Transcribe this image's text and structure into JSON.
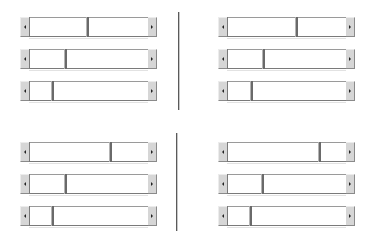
{
  "layout": {
    "groups": [
      {
        "name": "top-left",
        "x": 20,
        "width": 137,
        "rows": [
          {
            "y": 17,
            "thumb_pos": 57
          },
          {
            "y": 49,
            "thumb_pos": 35
          },
          {
            "y": 81,
            "thumb_pos": 22
          }
        ]
      },
      {
        "name": "top-right",
        "x": 218,
        "width": 137,
        "rows": [
          {
            "y": 17,
            "thumb_pos": 68
          },
          {
            "y": 49,
            "thumb_pos": 35
          },
          {
            "y": 81,
            "thumb_pos": 23
          }
        ]
      },
      {
        "name": "bottom-left",
        "x": 20,
        "width": 137,
        "rows": [
          {
            "y": 142,
            "thumb_pos": 80
          },
          {
            "y": 174,
            "thumb_pos": 35
          },
          {
            "y": 206,
            "thumb_pos": 22
          }
        ]
      },
      {
        "name": "bottom-right",
        "x": 218,
        "width": 137,
        "rows": [
          {
            "y": 142,
            "thumb_pos": 91
          },
          {
            "y": 174,
            "thumb_pos": 34
          },
          {
            "y": 206,
            "thumb_pos": 22
          }
        ]
      }
    ],
    "dividers": [
      {
        "x": 178,
        "top": 12,
        "bottom": 110
      },
      {
        "x": 176,
        "top": 133,
        "bottom": 231
      }
    ]
  },
  "icons": {
    "left_arrow": "left-arrow-icon",
    "right_arrow": "right-arrow-icon"
  },
  "colors": {
    "button_face": "#d6d6d6",
    "track": "#ffffff",
    "thumb_edge": "#6a6a6a",
    "divider": "#5a5a5a"
  }
}
